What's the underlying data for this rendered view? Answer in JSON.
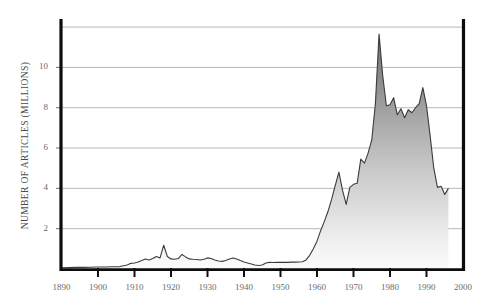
{
  "chart_data": {
    "type": "area",
    "title": "",
    "xlabel": "",
    "ylabel": "NUMBER OF ARTICLES (MILLIONS)",
    "xlim": [
      1890,
      2000
    ],
    "ylim": [
      0,
      12.4
    ],
    "grid": true,
    "legend": null,
    "x_ticks": [
      "1890",
      "1900",
      "1910",
      "1920",
      "1930",
      "1940",
      "1950",
      "1960",
      "1970",
      "1980",
      "1990",
      "2000"
    ],
    "y_ticks": [
      "2",
      "4",
      "6",
      "8",
      "10"
    ],
    "series": [
      {
        "name": "Number of articles",
        "x": [
          1890,
          1892,
          1894,
          1896,
          1898,
          1900,
          1902,
          1904,
          1906,
          1908,
          1909,
          1910,
          1911,
          1912,
          1913,
          1914,
          1915,
          1916,
          1917,
          1918,
          1919,
          1920,
          1921,
          1922,
          1923,
          1924,
          1925,
          1926,
          1927,
          1928,
          1929,
          1930,
          1931,
          1932,
          1933,
          1934,
          1935,
          1936,
          1937,
          1938,
          1939,
          1940,
          1941,
          1942,
          1943,
          1944,
          1945,
          1946,
          1947,
          1948,
          1949,
          1950,
          1951,
          1952,
          1953,
          1954,
          1955,
          1956,
          1957,
          1958,
          1959,
          1960,
          1961,
          1962,
          1963,
          1964,
          1965,
          1966,
          1967,
          1968,
          1969,
          1970,
          1971,
          1972,
          1973,
          1974,
          1975,
          1976,
          1977,
          1978,
          1979,
          1980,
          1981,
          1982,
          1983,
          1984,
          1985,
          1986,
          1987,
          1988,
          1989,
          1990,
          1991,
          1992,
          1993,
          1994,
          1995,
          1996
        ],
        "y": [
          0.06,
          0.07,
          0.08,
          0.08,
          0.09,
          0.1,
          0.1,
          0.11,
          0.12,
          0.2,
          0.28,
          0.3,
          0.35,
          0.42,
          0.5,
          0.45,
          0.52,
          0.62,
          0.55,
          1.18,
          0.62,
          0.5,
          0.48,
          0.52,
          0.72,
          0.6,
          0.5,
          0.48,
          0.47,
          0.45,
          0.48,
          0.55,
          0.52,
          0.45,
          0.4,
          0.38,
          0.42,
          0.5,
          0.55,
          0.5,
          0.42,
          0.35,
          0.3,
          0.25,
          0.2,
          0.17,
          0.2,
          0.3,
          0.33,
          0.32,
          0.33,
          0.33,
          0.33,
          0.33,
          0.34,
          0.34,
          0.35,
          0.36,
          0.45,
          0.68,
          1.0,
          1.38,
          1.9,
          2.35,
          2.85,
          3.45,
          4.15,
          4.8,
          3.9,
          3.2,
          4.05,
          4.2,
          4.25,
          5.45,
          5.25,
          5.75,
          6.4,
          8.2,
          11.65,
          9.6,
          8.1,
          8.15,
          8.5,
          7.65,
          7.95,
          7.5,
          7.9,
          7.75,
          8.0,
          8.2,
          9.0,
          8.1,
          6.6,
          5.0,
          4.05,
          4.1,
          3.7,
          4.0
        ]
      }
    ]
  },
  "axes": {
    "y_label_text": "NUMBER OF ARTICLES (MILLIONS)"
  }
}
